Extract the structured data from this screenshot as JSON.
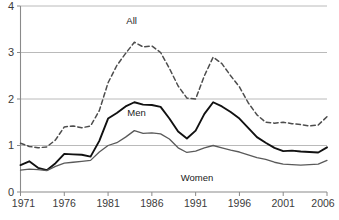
{
  "chart_data": {
    "type": "line",
    "title": "",
    "subtitle": "",
    "xlabel": "",
    "ylabel": "",
    "xlim": [
      1971,
      2006
    ],
    "ylim": [
      0,
      4
    ],
    "grid": true,
    "grid_axis": "y",
    "legend_position": "inline-annotations",
    "x": [
      1971,
      1972,
      1973,
      1974,
      1975,
      1976,
      1977,
      1978,
      1979,
      1980,
      1981,
      1982,
      1983,
      1984,
      1985,
      1986,
      1987,
      1988,
      1989,
      1990,
      1991,
      1992,
      1993,
      1994,
      1995,
      1996,
      1997,
      1998,
      1999,
      2000,
      2001,
      2002,
      2003,
      2004,
      2005,
      2006
    ],
    "y_ticks": [
      0,
      1,
      2,
      3,
      4
    ],
    "y_tick_labels": [
      "0",
      "1",
      "2",
      "3",
      "4"
    ],
    "x_ticks": [
      1971,
      1976,
      1981,
      1986,
      1991,
      1996,
      2001,
      2006
    ],
    "x_tick_labels": [
      "1971",
      "1976",
      "1981",
      "1986",
      "1991",
      "1996",
      "2001",
      "2006"
    ],
    "series": [
      {
        "name": "All",
        "style": "dashed",
        "color": "#4d4d4d",
        "width": 1.5,
        "label_x": 1984,
        "values": [
          1.05,
          0.98,
          0.95,
          0.97,
          1.12,
          1.4,
          1.42,
          1.38,
          1.42,
          1.75,
          2.35,
          2.72,
          2.98,
          3.22,
          3.12,
          3.14,
          3.0,
          2.66,
          2.28,
          2.02,
          2.0,
          2.5,
          2.9,
          2.76,
          2.5,
          2.26,
          1.92,
          1.66,
          1.5,
          1.48,
          1.5,
          1.47,
          1.45,
          1.42,
          1.44,
          1.62
        ]
      },
      {
        "name": "Men",
        "style": "solid",
        "color": "#111111",
        "width": 1.9,
        "label_x": 1984,
        "values": [
          0.58,
          0.66,
          0.52,
          0.47,
          0.62,
          0.82,
          0.81,
          0.8,
          0.76,
          1.1,
          1.58,
          1.7,
          1.84,
          1.93,
          1.88,
          1.87,
          1.83,
          1.58,
          1.3,
          1.15,
          1.32,
          1.68,
          1.93,
          1.84,
          1.72,
          1.58,
          1.38,
          1.18,
          1.06,
          0.95,
          0.88,
          0.89,
          0.87,
          0.86,
          0.85,
          0.96
        ]
      },
      {
        "name": "Women",
        "style": "solid",
        "color": "#5a5a5a",
        "width": 1.3,
        "label_x": 1991,
        "values": [
          0.47,
          0.49,
          0.48,
          0.46,
          0.55,
          0.62,
          0.64,
          0.66,
          0.68,
          0.86,
          1.0,
          1.06,
          1.18,
          1.32,
          1.26,
          1.27,
          1.25,
          1.14,
          0.95,
          0.85,
          0.88,
          0.95,
          1.0,
          0.95,
          0.9,
          0.86,
          0.8,
          0.74,
          0.7,
          0.64,
          0.6,
          0.59,
          0.58,
          0.59,
          0.6,
          0.68
        ]
      }
    ]
  }
}
